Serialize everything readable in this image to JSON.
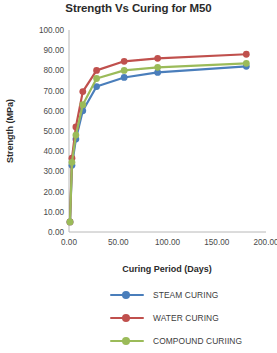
{
  "chart_data": {
    "type": "line",
    "title": "Strength Vs Curing for M50",
    "xlabel": "Curing Period (Days)",
    "ylabel": "Strength (MPa)",
    "xlim": [
      0,
      200
    ],
    "ylim": [
      0,
      100
    ],
    "xticks": [
      0,
      50,
      100,
      150,
      200
    ],
    "yticks": [
      0,
      10,
      20,
      30,
      40,
      50,
      60,
      70,
      80,
      90,
      100
    ],
    "xtick_labels": [
      "0.00",
      "50.00",
      "100.00",
      "150.00",
      "200.00"
    ],
    "ytick_labels": [
      "0.00",
      "10.00",
      "20.00",
      "30.00",
      "40.00",
      "50.00",
      "60.00",
      "70.00",
      "80.00",
      "90.00",
      "100.00"
    ],
    "grid": false,
    "legend_position": "bottom",
    "x": [
      1,
      3,
      7,
      14,
      28,
      56,
      90,
      180
    ],
    "series": [
      {
        "name": "STEAM CURING",
        "color": "#4a7ebb",
        "values": [
          5.0,
          33.0,
          46.0,
          60.0,
          72.0,
          76.5,
          79.0,
          82.0
        ]
      },
      {
        "name": "WATER CURING",
        "color": "#c0504d",
        "values": [
          5.0,
          36.5,
          52.0,
          69.5,
          80.0,
          84.5,
          86.0,
          88.0
        ]
      },
      {
        "name": "COMPOUND CURIING",
        "color": "#9bbb59",
        "values": [
          5.0,
          34.5,
          48.0,
          63.0,
          76.0,
          80.0,
          81.5,
          83.5
        ]
      }
    ]
  }
}
